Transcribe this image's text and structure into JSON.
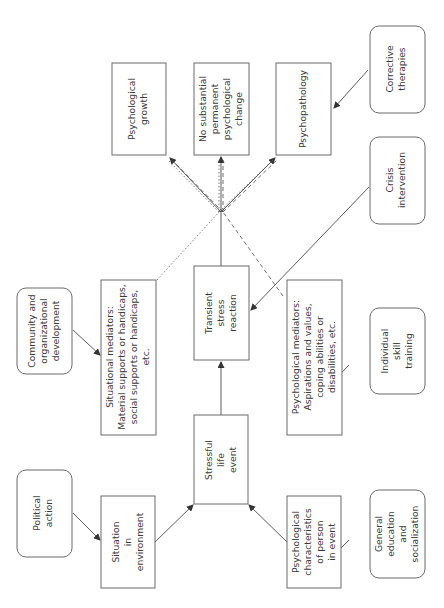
{
  "diagram": {
    "title": "",
    "orientation": "rotated-90-ccw",
    "nodes": {
      "political_action": {
        "lines": [
          "Political",
          "action"
        ]
      },
      "situation_in_environment": {
        "lines": [
          "Situation",
          "in",
          "environment"
        ]
      },
      "stressful_life_event": {
        "lines": [
          "Stressful",
          "life",
          "event"
        ]
      },
      "psych_characteristics": {
        "lines": [
          "Psychological",
          "characteristics",
          "of person",
          "in event"
        ]
      },
      "general_education": {
        "lines": [
          "General",
          "education",
          "and",
          "socialization"
        ]
      },
      "community_dev": {
        "lines": [
          "Community and",
          "organizational",
          "development"
        ]
      },
      "situational_mediators": {
        "lines": [
          "Situational mediators:",
          "Material supports or handicaps,",
          "social supports or handicaps,",
          "etc."
        ]
      },
      "transient_stress": {
        "lines": [
          "Transient",
          "stress",
          "reaction"
        ]
      },
      "psychological_mediators": {
        "lines": [
          "Psychological mediators:",
          "Aspirations and values,",
          "coping abilities or",
          "disabilities, etc."
        ]
      },
      "individual_skill": {
        "lines": [
          "Individual",
          "skill",
          "training"
        ]
      },
      "crisis_intervention": {
        "lines": [
          "Crisis",
          "intervention"
        ]
      },
      "psych_growth": {
        "lines": [
          "Psychological",
          "growth"
        ]
      },
      "no_change": {
        "lines": [
          "No substantial",
          "permanent",
          "psychological",
          "change"
        ]
      },
      "psychopathology": {
        "lines": [
          "Psychopathology"
        ]
      },
      "corrective_therapies": {
        "lines": [
          "Corrective",
          "therapies"
        ]
      }
    },
    "edges": [
      {
        "from": "political_action",
        "to": "situation_in_environment"
      },
      {
        "from": "situation_in_environment",
        "to": "stressful_life_event"
      },
      {
        "from": "psych_characteristics",
        "to": "stressful_life_event"
      },
      {
        "from": "general_education",
        "to": "psych_characteristics"
      },
      {
        "from": "community_dev",
        "to": "situational_mediators"
      },
      {
        "from": "stressful_life_event",
        "to": "transient_stress"
      },
      {
        "from": "crisis_intervention",
        "to": "transient_stress"
      },
      {
        "from": "individual_skill",
        "to": "psychological_mediators"
      },
      {
        "from": "transient_stress",
        "to": "psych_growth"
      },
      {
        "from": "transient_stress",
        "to": "no_change"
      },
      {
        "from": "transient_stress",
        "to": "psychopathology"
      },
      {
        "from": "situational_mediators",
        "to": "outcomes",
        "style": "dotted"
      },
      {
        "from": "psychological_mediators",
        "to": "outcomes",
        "style": "dashed"
      },
      {
        "from": "corrective_therapies",
        "to": "psychopathology"
      }
    ],
    "colors": {
      "stroke": "#6b6b6b",
      "text": "#3a3a3a",
      "background": "#ffffff"
    }
  }
}
